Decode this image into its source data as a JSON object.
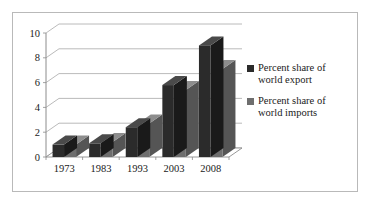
{
  "chart_data": {
    "type": "bar",
    "title": "",
    "subtitle": "",
    "xlabel": "",
    "ylabel": "",
    "categories": [
      "1973",
      "1983",
      "1993",
      "2003",
      "2008"
    ],
    "series": [
      {
        "name": "Percent share of world export",
        "color": "#2b2b2b",
        "values": [
          1.0,
          1.1,
          2.4,
          5.8,
          9.0
        ]
      },
      {
        "name": "Percent share of world imports",
        "color": "#6e6e6e",
        "values": [
          1.0,
          1.2,
          2.7,
          5.4,
          7.1
        ]
      }
    ],
    "ylim": [
      0,
      10
    ],
    "yticks": [
      0,
      2,
      4,
      6,
      8,
      10
    ],
    "ytick_labels": [
      "0",
      "2",
      "4",
      "6",
      "8",
      "10"
    ],
    "grid": true,
    "grid_axis": "y",
    "legend_position": "right",
    "style": "3d-clustered-column"
  },
  "legend": {
    "entries": [
      {
        "label": "Percent share of\nworld export",
        "swatch_color": "#2b2b2b"
      },
      {
        "label": "Percent share of\nworld imports",
        "swatch_color": "#6e6e6e"
      }
    ]
  },
  "axes": {
    "y_tick_labels": [
      "10",
      "8",
      "6",
      "4",
      "2",
      "0"
    ],
    "x_tick_labels": [
      "1973",
      "1983",
      "1993",
      "2003",
      "2008"
    ]
  },
  "colors": {
    "series_export": "#2b2b2b",
    "series_export_top": "#4a4a4a",
    "series_export_side": "#1a1a1a",
    "series_imports": "#6e6e6e",
    "series_imports_top": "#8d8d8d",
    "series_imports_side": "#555555",
    "gridline": "#a8a8a8",
    "axis": "#8c8c8c",
    "frame": "#b9b9b9",
    "background": "#ffffff",
    "text": "#1a1a1a"
  }
}
